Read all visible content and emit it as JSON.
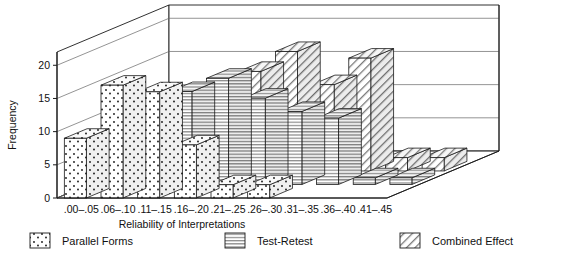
{
  "chart_data": {
    "type": "bar",
    "title": "",
    "subtitle": "",
    "xlabel": "Reliability of Interpretations",
    "ylabel": "Frequency",
    "ylim": [
      0,
      22
    ],
    "yticks": [
      0,
      5,
      10,
      15,
      20
    ],
    "grid": true,
    "projection": "3d-grouped-bars",
    "legend_position": "bottom",
    "categories": [
      ".00–.05",
      ".06–.10",
      ".11–.15",
      ".16–.20",
      ".21–.25",
      ".26–.30",
      ".31–.35",
      ".36–.40",
      ".41–.45"
    ],
    "series": [
      {
        "name": "Parallel Forms",
        "pattern": "dots",
        "values": [
          9,
          17,
          16,
          8,
          2,
          2,
          0,
          0,
          0
        ]
      },
      {
        "name": "Test-Retest",
        "pattern": "horizontal-lines",
        "values": [
          3,
          3,
          14,
          16,
          13,
          11,
          10,
          1,
          1
        ]
      },
      {
        "name": "Combined Effect",
        "pattern": "diagonal-hatch",
        "values": [
          0,
          0,
          0,
          15,
          18,
          13,
          17,
          2,
          2
        ]
      }
    ]
  },
  "axis": {
    "y_label": "Frequency",
    "x_label": "Reliability of Interpretations",
    "y_tick_labels": [
      "0",
      "5",
      "10",
      "15",
      "20"
    ],
    "x_tick_labels": [
      ".00–.05",
      ".06–.10",
      ".11–.15",
      ".16–.20",
      ".21–.25",
      ".26–.30",
      ".31–.35",
      ".36–.40",
      ".41–.45"
    ]
  },
  "legend": {
    "items": [
      {
        "label": "Parallel Forms",
        "swatch": "dots-swatch"
      },
      {
        "label": "Test-Retest",
        "swatch": "horizontal-lines-swatch"
      },
      {
        "label": "Combined Effect",
        "swatch": "diagonal-hatch-swatch"
      }
    ]
  },
  "colors": {
    "line": "#1a1a1a",
    "grid": "#666666",
    "fill": "#ffffff",
    "side_shade": "#e6e6e6",
    "top_shade": "#f2f2f2"
  }
}
